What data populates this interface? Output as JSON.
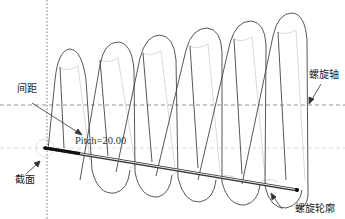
{
  "diagram": {
    "labels": {
      "pitch_cn": "间距",
      "pitch_value": "Pitch=20.00",
      "section": "截面",
      "helix_axis": "螺旋轴",
      "helix_profile": "螺旋轮廓"
    },
    "colors": {
      "line": "#444444",
      "hidden_line": "#cccccc",
      "axis": "#666666",
      "background": "#ffffff"
    },
    "geometry": {
      "loop_count": 6,
      "vertical_axis_x": 47,
      "helix_axis_y": 105,
      "section_line_y": 148,
      "profile_start": [
        45,
        148
      ],
      "profile_end": [
        297,
        190
      ]
    }
  }
}
